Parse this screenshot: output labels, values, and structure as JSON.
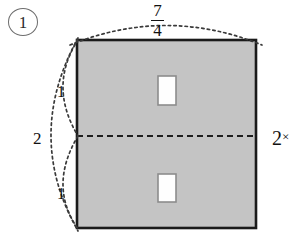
{
  "figure": {
    "problem_number": "1",
    "colors": {
      "fill_gray": "#c4c4c4",
      "outline_black": "#1a1a1a",
      "inner_white": "#fefefe",
      "dotted_gray": "#3a3a3a",
      "circle_gray": "#6d6d6d"
    },
    "rect": {
      "x": 77,
      "y": 40,
      "width": 179,
      "height": 188
    },
    "midline": {
      "y": 136,
      "style": "dashed"
    },
    "inner_squares": [
      {
        "id": "upper",
        "x": 158,
        "y": 76,
        "width": 18,
        "height": 29
      },
      {
        "id": "lower",
        "x": 158,
        "y": 174,
        "width": 18,
        "height": 28
      }
    ],
    "labels": {
      "top_width": {
        "numerator": "7",
        "denominator": "4",
        "text": "7/4",
        "position": "top"
      },
      "right_height": {
        "value": "2",
        "operator": "×",
        "text": "2×",
        "position": "right"
      },
      "left_total": {
        "value": "2",
        "position": "left-outer"
      },
      "left_upper_half": {
        "value": "1",
        "position": "left-inner-upper"
      },
      "left_lower_half": {
        "value": "1",
        "position": "left-inner-lower"
      }
    }
  }
}
